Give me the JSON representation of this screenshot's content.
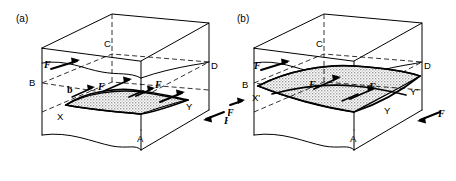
{
  "figure": {
    "type": "line-diagram",
    "background_color": "#ffffff",
    "line_color": "#000000",
    "shade_color": "#b9b9b9"
  },
  "panels": [
    {
      "id": "a",
      "label": "(a)",
      "vertices": [
        {
          "name": "A",
          "label": "A"
        },
        {
          "name": "B",
          "label": "B"
        },
        {
          "name": "C",
          "label": "C"
        },
        {
          "name": "D",
          "label": "D"
        }
      ],
      "loop_points": [
        {
          "name": "X",
          "label": "X"
        },
        {
          "name": "Y",
          "label": "Y"
        }
      ],
      "burgers_vector": {
        "label": "b"
      },
      "forces": [
        {
          "name": "force-upper-left",
          "label": "F"
        },
        {
          "name": "force-upper-mid",
          "label": "F"
        },
        {
          "name": "force-upper-right",
          "label": "F"
        },
        {
          "name": "force-loop-left",
          "label": "F"
        },
        {
          "name": "force-loop-right",
          "label": "F"
        },
        {
          "name": "force-edge-right",
          "label": "F"
        }
      ]
    },
    {
      "id": "b",
      "label": "(b)",
      "vertices": [
        {
          "name": "A",
          "label": "A"
        },
        {
          "name": "B",
          "label": "B"
        },
        {
          "name": "C",
          "label": "C"
        },
        {
          "name": "D",
          "label": "D"
        }
      ],
      "loop_points": [
        {
          "name": "X-prime",
          "label": "X'"
        },
        {
          "name": "Y-prime",
          "label": "Y'"
        },
        {
          "name": "Y",
          "label": "Y"
        }
      ],
      "forces": [
        {
          "name": "force-upper-left",
          "label": "F"
        },
        {
          "name": "force-loop-left",
          "label": "F"
        },
        {
          "name": "force-loop-right",
          "label": "F"
        },
        {
          "name": "force-edge-left",
          "label": "F"
        },
        {
          "name": "force-edge-right",
          "label": "F"
        }
      ]
    }
  ]
}
